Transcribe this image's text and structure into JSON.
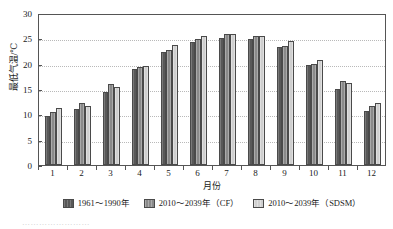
{
  "chart_data": {
    "type": "bar",
    "title": "",
    "xlabel": "月份",
    "ylabel": "最低气温/℃",
    "ylim": [
      0,
      30
    ],
    "yticks": [
      0,
      5,
      10,
      15,
      20,
      25,
      30
    ],
    "ytick_labels": [
      "0",
      "5",
      "10",
      "15",
      "20",
      "25",
      "30"
    ],
    "grid": true,
    "legend_position": "bottom",
    "categories": [
      "1",
      "2",
      "3",
      "4",
      "5",
      "6",
      "7",
      "8",
      "9",
      "10",
      "11",
      "12"
    ],
    "series": [
      {
        "name": "1961～1990年",
        "color": "#585858",
        "values": [
          9.7,
          11.1,
          14.5,
          18.9,
          22.3,
          24.2,
          25.0,
          24.8,
          23.2,
          19.8,
          15.1,
          10.7
        ]
      },
      {
        "name": "2010～2039年（CF）",
        "color": "#8a8a8a",
        "values": [
          10.5,
          12.3,
          16.0,
          19.3,
          22.7,
          24.9,
          25.9,
          25.5,
          23.5,
          20.0,
          16.6,
          11.7
        ]
      },
      {
        "name": "2010～2039年（SDSM）",
        "color": "#cfcfcf",
        "values": [
          11.3,
          11.7,
          15.4,
          19.6,
          23.6,
          25.4,
          25.8,
          25.5,
          24.4,
          20.7,
          16.2,
          12.2
        ]
      }
    ]
  },
  "legend": {
    "items": [
      {
        "label": "1961～1990年"
      },
      {
        "label": "2010～2039年（CF）"
      },
      {
        "label": "2010～2039年（SDSM）"
      }
    ]
  },
  "caption_remnant": "……………………"
}
